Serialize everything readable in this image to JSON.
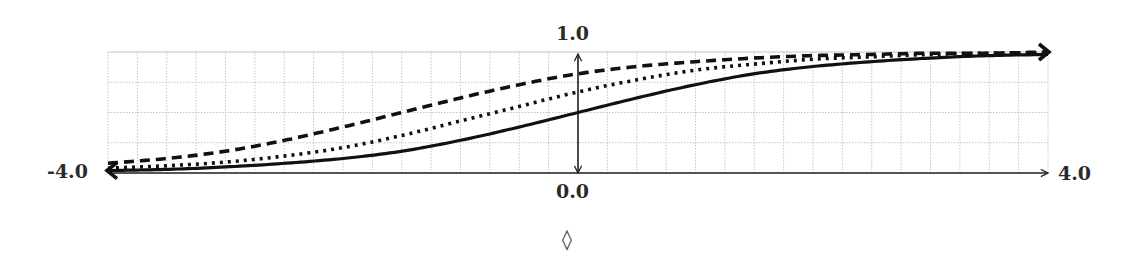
{
  "chart_data": {
    "type": "line",
    "title": "",
    "xlabel": "",
    "ylabel": "",
    "xlim": [
      -4.0,
      4.0
    ],
    "ylim": [
      0.0,
      1.0
    ],
    "grid": true,
    "grid_step": {
      "x": 0.25,
      "y": 0.25
    },
    "legend": null,
    "tick_labels": {
      "x_min": "-4.0",
      "x_max": "4.0",
      "y_min": "0.0",
      "y_max": "1.0"
    },
    "annotations": [
      "◊"
    ],
    "x": [
      -4.0,
      -3.5,
      -3.0,
      -2.5,
      -2.0,
      -1.5,
      -1.0,
      -0.5,
      0.0,
      0.5,
      1.0,
      1.5,
      2.0,
      2.5,
      3.0,
      3.5,
      4.0
    ],
    "series": [
      {
        "name": "solid",
        "style": "solid",
        "values": [
          0.02,
          0.03,
          0.05,
          0.08,
          0.12,
          0.18,
          0.27,
          0.38,
          0.5,
          0.62,
          0.73,
          0.82,
          0.88,
          0.92,
          0.95,
          0.97,
          0.98
        ]
      },
      {
        "name": "dotted",
        "style": "dotted",
        "values": [
          0.04,
          0.06,
          0.09,
          0.14,
          0.21,
          0.31,
          0.43,
          0.55,
          0.67,
          0.77,
          0.85,
          0.9,
          0.94,
          0.96,
          0.98,
          0.99,
          0.99
        ]
      },
      {
        "name": "dashed",
        "style": "dashed",
        "values": [
          0.08,
          0.12,
          0.18,
          0.27,
          0.38,
          0.5,
          0.62,
          0.73,
          0.82,
          0.88,
          0.92,
          0.95,
          0.97,
          0.98,
          0.99,
          0.99,
          1.0
        ]
      }
    ]
  },
  "axes": {
    "x_min_label": "-4.0",
    "x_max_label": "4.0",
    "y_min_label": "0.0",
    "y_max_label": "1.0"
  },
  "caption": {
    "symbol": "◊"
  },
  "colors": {
    "curve": "#111111",
    "axis": "#222222",
    "grid": "#c4c4c4"
  }
}
